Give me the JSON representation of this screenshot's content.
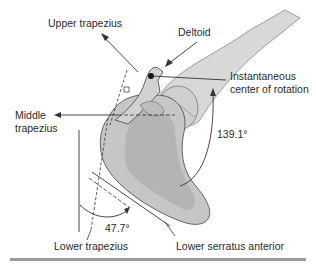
{
  "figure": {
    "labels": {
      "upper_trapezius": "Upper trapezius",
      "deltoid": "Deltoid",
      "icr_line1": "Instantaneous",
      "icr_line2": "center of rotation",
      "middle_trapezius_line1": "Middle",
      "middle_trapezius_line2": "trapezius",
      "angle_upper": "139.1°",
      "angle_lower": "47.7°",
      "lower_trapezius": "Lower trapezius",
      "lower_serratus_anterior": "Lower serratus anterior"
    },
    "colors": {
      "bone_fill": "#c8c8c8",
      "bone_dark": "#a8a8a8",
      "humerus_fill": "#d6d6d6",
      "line": "#333333",
      "bottom_rule": "#9a9a9a"
    }
  }
}
